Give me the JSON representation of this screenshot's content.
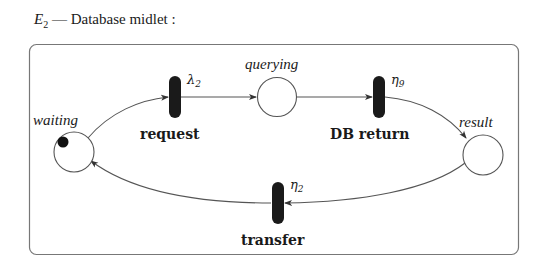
{
  "title": {
    "symbol": "E",
    "subscript": "2",
    "text": " — Database midlet :"
  },
  "places": [
    {
      "id": "waiting",
      "label": "waiting",
      "tokens": 1
    },
    {
      "id": "querying",
      "label": "querying",
      "tokens": 0
    },
    {
      "id": "result",
      "label": "result",
      "tokens": 0
    }
  ],
  "transitions": [
    {
      "id": "request",
      "label": "request",
      "rate_symbol": "λ",
      "rate_subscript": "2"
    },
    {
      "id": "db_return",
      "label": "DB return",
      "rate_symbol": "η",
      "rate_subscript": "9"
    },
    {
      "id": "transfer",
      "label": "transfer",
      "rate_symbol": "η",
      "rate_subscript": "2"
    }
  ],
  "arcs": [
    {
      "from": "waiting",
      "to": "request"
    },
    {
      "from": "request",
      "to": "querying"
    },
    {
      "from": "querying",
      "to": "db_return"
    },
    {
      "from": "db_return",
      "to": "result"
    },
    {
      "from": "result",
      "to": "transfer"
    },
    {
      "from": "transfer",
      "to": "waiting"
    }
  ],
  "colors": {
    "stroke": "#555555",
    "transition_fill": "#1a1a1a",
    "token_fill": "#111111",
    "border": "#777777"
  }
}
